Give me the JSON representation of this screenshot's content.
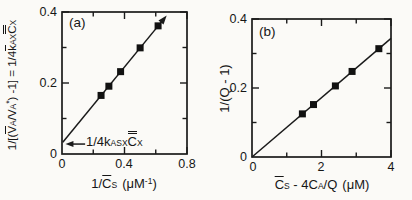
{
  "colors": {
    "ink": "#1a1a1a",
    "marker": "#111111",
    "background": "#fbfaf7"
  },
  "figure": {
    "panel_a": {
      "tag": "(a)",
      "ylabel": {
        "f1": "1/[(",
        "v1": "V",
        "v1sub": "A",
        "f2": "/",
        "v2": "V",
        "v2sub": "A",
        "v2sup": "*",
        "f3": ") -1] = 1/4",
        "k": "k",
        "ksub": "AX",
        "c": "C",
        "csub": "X"
      },
      "xlabel": {
        "f1": "1/",
        "c": "C",
        "csub": "S",
        "f2": "(μM",
        "sup": "-1",
        "f3": ")"
      },
      "annotation": {
        "f1": "1/4k",
        "ksub": "ASX",
        "c": "C",
        "csub": "X"
      },
      "xticks": [
        "0",
        "0.4",
        "0.8"
      ],
      "yticks": [
        "0",
        "0.2",
        "0.4"
      ]
    },
    "panel_b": {
      "tag": "(b)",
      "ylabel": "1/(Q - 1)",
      "xlabel": {
        "c": "C",
        "csub": "S",
        "f1": " - 4C",
        "f1sub": "A",
        "f2": "/Q",
        "unit": "(μM)"
      },
      "xticks": [
        "0",
        "2",
        "4"
      ],
      "yticks": [
        "0",
        "0.2",
        "0.4"
      ]
    }
  },
  "chart_data": [
    {
      "panel": "a",
      "type": "scatter",
      "title": "",
      "xlabel": "1/C̄S (μM⁻¹)",
      "ylabel": "1/[(V̄A/VA*) -1] = 1/4k̄AXC̿X",
      "xlim": [
        0,
        0.8
      ],
      "ylim": [
        0,
        0.4
      ],
      "x_tick_labels": [
        "0",
        "0.4",
        "0.8"
      ],
      "y_tick_labels": [
        "0",
        "0.2",
        "0.4"
      ],
      "xticks_major": [
        0.4,
        0.8
      ],
      "xticks_minor": [
        0.2,
        0.6
      ],
      "yticks_major": [
        0.2,
        0.4
      ],
      "yticks_minor": [
        0.1,
        0.3
      ],
      "points": {
        "x": [
          0.25,
          0.3,
          0.375,
          0.5,
          0.615
        ],
        "y": [
          0.165,
          0.191,
          0.232,
          0.299,
          0.361
        ]
      },
      "fit_line": {
        "x1": 0.005,
        "y1": 0.033,
        "x2": 0.67,
        "y2": 0.39,
        "arrow_end": true
      },
      "slope": 0.537,
      "y_intercept": 0.033,
      "annotation": {
        "text": "1/4kASX C̿X",
        "arrow": {
          "x1": 0.148,
          "y1": 0.028,
          "x2": 0.022,
          "y2": 0.028
        }
      },
      "legend": null,
      "grid": false
    },
    {
      "panel": "b",
      "type": "scatter",
      "title": "",
      "xlabel": "C̄S - 4CA/Q (μM)",
      "ylabel": "1/(Q - 1)",
      "xlim": [
        0,
        4
      ],
      "ylim": [
        0,
        0.4
      ],
      "x_tick_labels": [
        "0",
        "2",
        "4"
      ],
      "y_tick_labels": [
        "0",
        "0.2",
        "0.4"
      ],
      "xticks_major": [
        2,
        4
      ],
      "xticks_minor": [
        1,
        3
      ],
      "yticks_major": [
        0.2,
        0.4
      ],
      "yticks_minor": [
        0.1,
        0.3
      ],
      "points": {
        "x": [
          1.45,
          1.77,
          2.4,
          2.88,
          3.65
        ],
        "y": [
          0.125,
          0.152,
          0.206,
          0.248,
          0.314
        ]
      },
      "fit_line": {
        "x1": 0.0,
        "y1": 0.0,
        "x2": 4.0,
        "y2": 0.344,
        "arrow_end": false
      },
      "slope": 0.086,
      "y_intercept": 0.0,
      "legend": null,
      "grid": false
    }
  ]
}
